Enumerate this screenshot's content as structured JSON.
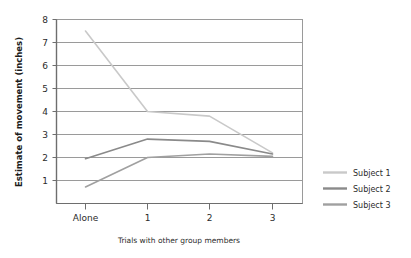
{
  "chart_data": {
    "type": "line",
    "title": "",
    "xlabel": "Trials with other group members",
    "ylabel": "Estimate of movement (inches)",
    "categories": [
      "Alone",
      "1",
      "2",
      "3"
    ],
    "x_tick_labels": [
      "Alone",
      "1",
      "2",
      "3"
    ],
    "y_tick_labels": [
      "1",
      "2",
      "3",
      "4",
      "5",
      "6",
      "7",
      "8"
    ],
    "y_ticks": [
      1,
      2,
      3,
      4,
      5,
      6,
      7,
      8
    ],
    "ylim": [
      0,
      8
    ],
    "grid": "horizontal",
    "legend_position": "right",
    "series": [
      {
        "name": "Subject 1",
        "color": "#c9c9c9",
        "values": [
          7.5,
          4.0,
          3.8,
          2.2
        ]
      },
      {
        "name": "Subject 2",
        "color": "#8a8a8a",
        "values": [
          1.95,
          2.8,
          2.7,
          2.15
        ]
      },
      {
        "name": "Subject 3",
        "color": "#a0a0a0",
        "values": [
          0.72,
          2.0,
          2.15,
          2.05
        ]
      }
    ]
  },
  "axes": {
    "y_title": "Estimate of movement (inches)",
    "x_title": "Trials with other group members",
    "y_labels": {
      "t8": "8",
      "t7": "7",
      "t6": "6",
      "t5": "5",
      "t4": "4",
      "t3": "3",
      "t2": "2",
      "t1": "1"
    },
    "x_labels": {
      "c0": "Alone",
      "c1": "1",
      "c2": "2",
      "c3": "3"
    }
  },
  "legend": {
    "items": [
      {
        "label": "Subject 1",
        "color": "#c9c9c9"
      },
      {
        "label": "Subject 2",
        "color": "#8a8a8a"
      },
      {
        "label": "Subject 3",
        "color": "#a0a0a0"
      }
    ]
  },
  "colors": {
    "background": "#ffffff",
    "frame": "#9a9a9a",
    "gridline": "#9a9a9a",
    "text": "#2b2b2b",
    "series1": "#c9c9c9",
    "series2": "#8a8a8a",
    "series3": "#a0a0a0"
  }
}
